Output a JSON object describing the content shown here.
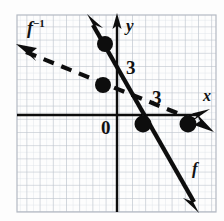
{
  "figure": {
    "background_color": "#fdfdfd",
    "ink_color": "#111111",
    "grid": {
      "minor_color": "#d9dde3",
      "major_color": "#b9bfc8",
      "left": 17,
      "top": 15,
      "right": 216,
      "bottom": 212,
      "minor_step": 6.6,
      "major_step": 13.2
    },
    "axes": {
      "x_axis_y": 115,
      "y_axis_x": 117,
      "x_label": "x",
      "y_label": "y",
      "origin_label": "0",
      "x_tick_label": "3",
      "y_tick_label": "3"
    },
    "curves": [
      {
        "name": "f",
        "label": "f",
        "style": "solid",
        "stroke_width": 4,
        "arrowheads": "both",
        "points": [
          [
            92,
            22
          ],
          [
            196,
            206
          ]
        ]
      },
      {
        "name": "f-inverse",
        "label": "f−1",
        "style": "dashed",
        "stroke_width": 4,
        "dash": "11 8",
        "arrowheads": "both",
        "points": [
          [
            24,
            51
          ],
          [
            205,
            124
          ]
        ]
      }
    ],
    "points": [
      {
        "name": "point-on-f-upper",
        "x": 105,
        "y": 44
      },
      {
        "name": "point-on-finv-upper",
        "x": 103,
        "y": 85
      },
      {
        "name": "point-on-f-x-intercept",
        "x": 143,
        "y": 124
      },
      {
        "name": "point-on-finv-right",
        "x": 188,
        "y": 124
      }
    ]
  },
  "labels": {
    "f_inverse": "f",
    "f_inverse_exp": "−1",
    "y_axis": "y",
    "x_axis": "x",
    "f": "f",
    "three_y": "3",
    "three_x": "3",
    "origin": "0"
  }
}
